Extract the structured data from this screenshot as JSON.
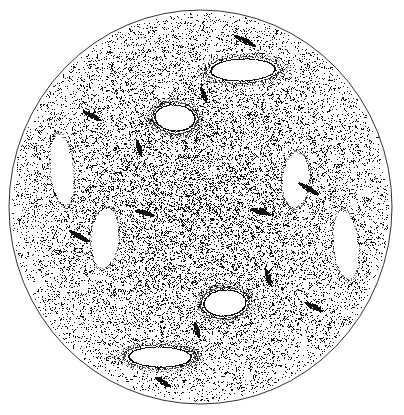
{
  "figure": {
    "title": "Poincare surface of section",
    "type": "scatter",
    "width": 404,
    "height": 415,
    "background_color": "#ffffff",
    "point_color": "#111111",
    "boundary_color": "#333333"
  },
  "chart_data": {
    "type": "scatter",
    "title": "Poincare surface of section",
    "xlabel": "",
    "ylabel": "",
    "xlim": [
      -1,
      1
    ],
    "ylim": [
      -1,
      1
    ],
    "grid": false,
    "legend_position": "none",
    "axes_visible": false,
    "tick_labels_x": [],
    "tick_labels_y": [],
    "annotations": [],
    "boundary": {
      "shape": "circle",
      "center_x": 200.5,
      "center_y": 207.0,
      "radius_x": 191.5,
      "radius_y": 197.0,
      "stroke_width": 1.0,
      "stroke_color": "#333333"
    },
    "series": [
      {
        "name": "chaotic-sea",
        "kind": "stochastic-orbit",
        "point_count": 21000,
        "marker": "pixel-dot",
        "marker_size": 1.0,
        "color": "#111111",
        "density_profile": "dense-core-sparse-rim",
        "core_density": 1.0,
        "rim_density": 0.34
      }
    ],
    "islands": [
      {
        "name": "island-top",
        "cx": 243,
        "cy": 70,
        "rx": 32,
        "ry": 11,
        "rot": -2,
        "shape": "flat-oval"
      },
      {
        "name": "island-upper-center",
        "cx": 175,
        "cy": 118,
        "rx": 20,
        "ry": 13,
        "rot": 4,
        "shape": "round-oval"
      },
      {
        "name": "island-lower-center",
        "cx": 225,
        "cy": 303,
        "rx": 21,
        "ry": 13,
        "rot": -4,
        "shape": "round-oval"
      },
      {
        "name": "island-bottom",
        "cx": 160,
        "cy": 357,
        "rx": 31,
        "ry": 10,
        "rot": 1,
        "shape": "flat-oval"
      }
    ],
    "voids": [
      {
        "name": "void-left-upper",
        "cx": 62,
        "cy": 170,
        "rx": 11,
        "ry": 35,
        "rot": -6,
        "shape": "lobe"
      },
      {
        "name": "void-left-lower",
        "cx": 105,
        "cy": 238,
        "rx": 13,
        "ry": 30,
        "rot": 5,
        "shape": "lobe"
      },
      {
        "name": "void-right-upper",
        "cx": 296,
        "cy": 180,
        "rx": 13,
        "ry": 27,
        "rot": 4,
        "shape": "lobe"
      },
      {
        "name": "void-right-lower",
        "cx": 346,
        "cy": 245,
        "rx": 12,
        "ry": 34,
        "rot": -6,
        "shape": "lobe"
      }
    ],
    "filaments": [
      {
        "name": "filament-top-right",
        "x": 245,
        "y": 41,
        "len": 24,
        "angle": 27,
        "weight": 2.6
      },
      {
        "name": "filament-upper-left",
        "x": 92,
        "y": 116,
        "len": 20,
        "angle": 28,
        "weight": 2.4
      },
      {
        "name": "filament-upper-mid",
        "x": 204,
        "y": 95,
        "len": 16,
        "angle": 70,
        "weight": 2.2
      },
      {
        "name": "filament-mid-left",
        "x": 139,
        "y": 148,
        "len": 17,
        "angle": 74,
        "weight": 2.1
      },
      {
        "name": "filament-right-mid",
        "x": 309,
        "y": 189,
        "len": 23,
        "angle": 30,
        "weight": 2.5
      },
      {
        "name": "filament-center-left",
        "x": 145,
        "y": 213,
        "len": 20,
        "angle": 16,
        "weight": 2.2
      },
      {
        "name": "filament-center-right",
        "x": 261,
        "y": 212,
        "len": 20,
        "angle": 16,
        "weight": 2.4
      },
      {
        "name": "filament-left-lower",
        "x": 79,
        "y": 236,
        "len": 22,
        "angle": 30,
        "weight": 2.4
      },
      {
        "name": "filament-lower-right",
        "x": 268,
        "y": 277,
        "len": 18,
        "angle": 72,
        "weight": 2.3
      },
      {
        "name": "filament-right-lower",
        "x": 314,
        "y": 307,
        "len": 19,
        "angle": 28,
        "weight": 2.3
      },
      {
        "name": "filament-lower-mid",
        "x": 197,
        "y": 330,
        "len": 16,
        "angle": 74,
        "weight": 2.2
      },
      {
        "name": "filament-bottom",
        "x": 163,
        "y": 382,
        "len": 18,
        "angle": 32,
        "weight": 2.3
      }
    ]
  }
}
